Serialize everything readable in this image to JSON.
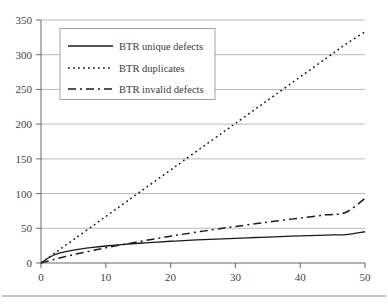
{
  "chart_data": {
    "type": "line",
    "title": "",
    "xlabel": "",
    "ylabel": "",
    "xlim": [
      0,
      50
    ],
    "ylim": [
      0,
      350
    ],
    "grid": "horizontal",
    "legend_position": "top-left-inside",
    "x_ticks": [
      "0",
      "10",
      "20",
      "30",
      "40",
      "50"
    ],
    "y_ticks": [
      "0",
      "50",
      "100",
      "150",
      "200",
      "250",
      "300",
      "350"
    ],
    "x": [
      0,
      1,
      2,
      3,
      4,
      5,
      6,
      8,
      10,
      12,
      14,
      16,
      18,
      20,
      22,
      25,
      28,
      30,
      33,
      36,
      40,
      44,
      47,
      50
    ],
    "series": [
      {
        "name": "BTR unique defects",
        "style": "solid",
        "values": [
          0,
          6.5,
          11.5,
          14.5,
          16.8,
          18.6,
          20.1,
          22.5,
          24.5,
          26.2,
          27.7,
          29.0,
          30.2,
          31.3,
          32.3,
          33.6,
          34.8,
          35.6,
          36.7,
          37.7,
          39.0,
          40.2,
          41.0,
          45.0
        ]
      },
      {
        "name": "BTR duplicates",
        "style": "dotted",
        "values": [
          0,
          6.7,
          13.4,
          20.1,
          26.8,
          33.5,
          40.2,
          53.6,
          67.0,
          80.4,
          93.8,
          107.2,
          120.6,
          134.0,
          147.4,
          167.5,
          187.6,
          201.0,
          221.1,
          241.2,
          268.0,
          294.8,
          314.9,
          333.0
        ]
      },
      {
        "name": "BTR invalid defects",
        "style": "dashed",
        "values": [
          0,
          2.6,
          5.1,
          7.5,
          9.8,
          12.0,
          14.1,
          18.1,
          21.9,
          25.5,
          29.0,
          32.3,
          35.5,
          38.6,
          41.6,
          45.9,
          50.0,
          52.6,
          56.4,
          60.1,
          64.8,
          69.4,
          72.7,
          93.0
        ]
      }
    ]
  },
  "legend": {
    "entries": [
      {
        "label": "BTR unique defects",
        "style": "solid"
      },
      {
        "label": "BTR duplicates",
        "style": "dotted"
      },
      {
        "label": "BTR invalid defects",
        "style": "dashed"
      }
    ]
  }
}
